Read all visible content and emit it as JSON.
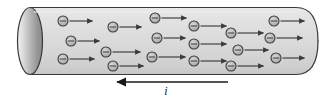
{
  "figure": {
    "conductor": {
      "name": "cylindrical-wire",
      "shape": "cylinder",
      "left_cap_shape": "ellipse",
      "right_cap_shape": "rounded-end",
      "body_color": "#d8d8d8",
      "body_highlight_color": "#e6e6e6",
      "body_shadow_color": "#c4c4c4",
      "outline_color": "#333333",
      "cap_light_color": "#f0f0f0",
      "cap_dark_color": "#8f8f8f",
      "x": 18,
      "y": 7,
      "width": 300,
      "height": 68
    },
    "charge_carriers": {
      "label": "electron",
      "sign": "–",
      "fill_color": "#b8b8b8",
      "stroke_color": "#3a3a3a",
      "radius": 5,
      "count": 18,
      "arrow_direction": "right",
      "arrow_color": "#3a3a3a",
      "items": [
        {
          "cx": 63,
          "cy": 21,
          "arrow_len": 23
        },
        {
          "cx": 71,
          "cy": 41,
          "arrow_len": 22
        },
        {
          "cx": 63,
          "cy": 59,
          "arrow_len": 25
        },
        {
          "cx": 113,
          "cy": 27,
          "arrow_len": 22
        },
        {
          "cx": 106,
          "cy": 52,
          "arrow_len": 28
        },
        {
          "cx": 113,
          "cy": 66,
          "arrow_len": 24
        },
        {
          "cx": 155,
          "cy": 18,
          "arrow_len": 25
        },
        {
          "cx": 157,
          "cy": 38,
          "arrow_len": 22
        },
        {
          "cx": 152,
          "cy": 57,
          "arrow_len": 27
        },
        {
          "cx": 194,
          "cy": 26,
          "arrow_len": 26
        },
        {
          "cx": 194,
          "cy": 44,
          "arrow_len": 26
        },
        {
          "cx": 194,
          "cy": 61,
          "arrow_len": 26
        },
        {
          "cx": 231,
          "cy": 33,
          "arrow_len": 26
        },
        {
          "cx": 238,
          "cy": 50,
          "arrow_len": 24
        },
        {
          "cx": 231,
          "cy": 66,
          "arrow_len": 26
        },
        {
          "cx": 274,
          "cy": 21,
          "arrow_len": 24
        },
        {
          "cx": 270,
          "cy": 38,
          "arrow_len": 26
        },
        {
          "cx": 276,
          "cy": 58,
          "arrow_len": 22
        }
      ]
    },
    "current_indicator": {
      "name": "conventional-current-arrow",
      "label": "i",
      "direction": "left",
      "color": "#1a1a1a",
      "line_x_start": 117,
      "line_x_end": 228,
      "line_y": 82,
      "label_x": 166,
      "label_y": 95
    }
  }
}
